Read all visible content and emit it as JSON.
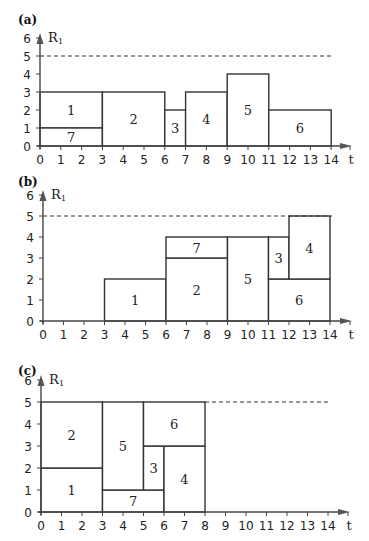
{
  "figure": {
    "panels": [
      {
        "id": "a",
        "label": "(a)",
        "y_axis_label": "R",
        "y_axis_subscript": "1",
        "x_axis_label": "t",
        "x_ticks": [
          0,
          1,
          2,
          3,
          4,
          5,
          6,
          7,
          8,
          9,
          10,
          11,
          12,
          13,
          14
        ],
        "y_ticks": [
          0,
          1,
          2,
          3,
          4,
          5,
          6
        ],
        "capacity": 5,
        "capacity_span": [
          0,
          14
        ],
        "jobs": [
          {
            "name": "1",
            "start": 0,
            "end": 3,
            "bottom": 1,
            "top": 3
          },
          {
            "name": "7",
            "start": 0,
            "end": 3,
            "bottom": 0,
            "top": 1
          },
          {
            "name": "2",
            "start": 3,
            "end": 6,
            "bottom": 0,
            "top": 3
          },
          {
            "name": "3",
            "start": 6,
            "end": 7,
            "bottom": 0,
            "top": 2
          },
          {
            "name": "4",
            "start": 7,
            "end": 9,
            "bottom": 0,
            "top": 3
          },
          {
            "name": "5",
            "start": 9,
            "end": 11,
            "bottom": 0,
            "top": 4
          },
          {
            "name": "6",
            "start": 11,
            "end": 14,
            "bottom": 0,
            "top": 2
          }
        ]
      },
      {
        "id": "b",
        "label": "(b)",
        "y_axis_label": "R",
        "y_axis_subscript": "1",
        "x_axis_label": "t",
        "x_ticks": [
          0,
          1,
          2,
          3,
          4,
          5,
          6,
          7,
          8,
          9,
          10,
          11,
          12,
          13,
          14
        ],
        "y_ticks": [
          0,
          1,
          2,
          3,
          4,
          5,
          6
        ],
        "capacity": 5,
        "capacity_span": [
          0,
          14
        ],
        "jobs": [
          {
            "name": "1",
            "start": 3,
            "end": 6,
            "bottom": 0,
            "top": 2
          },
          {
            "name": "2",
            "start": 6,
            "end": 9,
            "bottom": 0,
            "top": 3
          },
          {
            "name": "7",
            "start": 6,
            "end": 9,
            "bottom": 3,
            "top": 4
          },
          {
            "name": "5",
            "start": 9,
            "end": 11,
            "bottom": 0,
            "top": 4
          },
          {
            "name": "6",
            "start": 11,
            "end": 14,
            "bottom": 0,
            "top": 2
          },
          {
            "name": "3",
            "start": 11,
            "end": 12,
            "bottom": 2,
            "top": 4
          },
          {
            "name": "4",
            "start": 12,
            "end": 14,
            "bottom": 2,
            "top": 5
          }
        ]
      },
      {
        "id": "c",
        "label": "(c)",
        "y_axis_label": "R",
        "y_axis_subscript": "1",
        "x_axis_label": "t",
        "x_ticks": [
          0,
          1,
          2,
          3,
          4,
          5,
          6,
          7,
          8,
          9,
          10,
          11,
          12,
          13,
          14
        ],
        "y_ticks": [
          0,
          1,
          2,
          3,
          4,
          5,
          6
        ],
        "capacity": 5,
        "capacity_span": [
          8,
          14
        ],
        "jobs": [
          {
            "name": "1",
            "start": 0,
            "end": 3,
            "bottom": 0,
            "top": 2
          },
          {
            "name": "2",
            "start": 0,
            "end": 3,
            "bottom": 2,
            "top": 5
          },
          {
            "name": "7",
            "start": 3,
            "end": 6,
            "bottom": 0,
            "top": 1
          },
          {
            "name": "5",
            "start": 3,
            "end": 5,
            "bottom": 1,
            "top": 5
          },
          {
            "name": "3",
            "start": 5,
            "end": 6,
            "bottom": 1,
            "top": 3
          },
          {
            "name": "4",
            "start": 6,
            "end": 8,
            "bottom": 0,
            "top": 3
          },
          {
            "name": "6",
            "start": 5,
            "end": 8,
            "bottom": 3,
            "top": 5
          }
        ]
      }
    ]
  }
}
